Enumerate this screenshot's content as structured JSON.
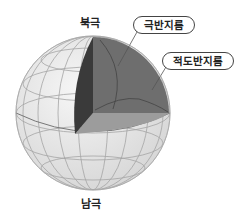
{
  "diagram": {
    "type": "hemisphere-cutaway-sphere",
    "labels": {
      "north_pole": "북극",
      "south_pole": "남극"
    },
    "callouts": [
      {
        "id": "polar-semicircle",
        "text": "극반지름"
      },
      {
        "id": "equatorial-semicircle",
        "text": "적도반지름"
      }
    ],
    "colors": {
      "sphere_fill": "#e6e6e6",
      "grid_line": "#9a9a9a",
      "wedge_dark": "#3a3a3a",
      "quadrant_mid": "#6e6e6e",
      "equator_plane": "#9c9c9c",
      "outline": "#555555"
    }
  }
}
